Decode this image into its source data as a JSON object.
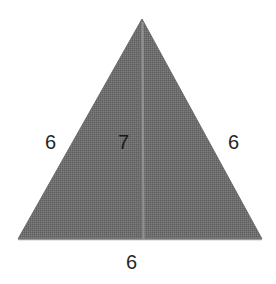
{
  "figure": {
    "kind": "triangle-with-altitude-diagram",
    "background_color": "#ffffff",
    "fill_color": "#6b6b6b",
    "fill_pattern": "halftone-dither",
    "altitude_line_color": "#8e8e8e",
    "label_color": "#262626",
    "shape": {
      "type": "isosceles-triangle",
      "apex": {
        "x": 142,
        "y": 19
      },
      "base_left": {
        "x": 18,
        "y": 239
      },
      "base_right": {
        "x": 262,
        "y": 239
      },
      "altitude": {
        "from_x": 142,
        "from_y": 19,
        "to_x": 143,
        "to_y": 239
      }
    },
    "labels": {
      "left_side": "6",
      "altitude": "7",
      "right_side": "6",
      "base": "6"
    }
  }
}
